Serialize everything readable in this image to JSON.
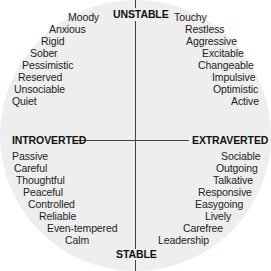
{
  "diagram": {
    "type": "personality-quadrant",
    "axes": {
      "top": "UNSTABLE",
      "bottom": "STABLE",
      "left": "INTROVERTED",
      "right": "EXTRAVERTED"
    },
    "quadrants": {
      "top_left": [
        "Moody",
        "Anxious",
        "Rigid",
        "Sober",
        "Pessimistic",
        "Reserved",
        "Unsociable",
        "Quiet"
      ],
      "top_right": [
        "Touchy",
        "Restless",
        "Aggressive",
        "Excitable",
        "Changeable",
        "Impulsive",
        "Optimistic",
        "Active"
      ],
      "bottom_left": [
        "Passive",
        "Careful",
        "Thoughtful",
        "Peaceful",
        "Controlled",
        "Reliable",
        "Even-tempered",
        "Calm"
      ],
      "bottom_right": [
        "Sociable",
        "Outgoing",
        "Talkative",
        "Responsive",
        "Easygoing",
        "Lively",
        "Carefree",
        "Leadership"
      ]
    },
    "colors": {
      "background": "#ffffff",
      "circle": "#eeeeee",
      "lines": "#444444",
      "text": "#222222"
    }
  }
}
